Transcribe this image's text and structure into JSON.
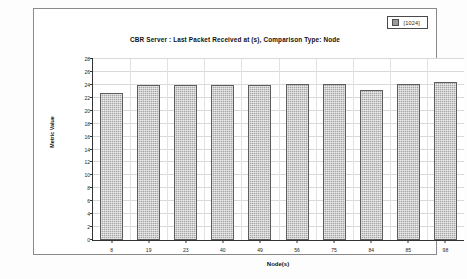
{
  "legend": {
    "swatch_color": "#9a9a9a",
    "label": "[1024]"
  },
  "chart_data": {
    "type": "bar",
    "title": "CBR Server :  Last Packet Received at (s), Comparison Type: Node",
    "xlabel": "Node(s)",
    "ylabel": "Metric Value",
    "categories": [
      "8",
      "19",
      "23",
      "40",
      "49",
      "56",
      "75",
      "84",
      "85",
      "98"
    ],
    "values": [
      22.8,
      24.0,
      24.0,
      24.0,
      24.0,
      24.1,
      24.1,
      23.2,
      24.1,
      24.4
    ],
    "series": [
      {
        "name": "[1024]",
        "values": [
          22.8,
          24.0,
          24.0,
          24.0,
          24.0,
          24.1,
          24.1,
          23.2,
          24.1,
          24.4
        ]
      }
    ],
    "ylim": [
      0,
      28
    ],
    "ytick_values": [
      0,
      2,
      4,
      6,
      8,
      10,
      12,
      14,
      16,
      18,
      20,
      22,
      24,
      26,
      28
    ],
    "ytick_labels": [
      "0",
      "2",
      "4",
      "6",
      "8",
      "10",
      "12",
      "14",
      "16",
      "18",
      "20",
      "22",
      "24",
      "26",
      "28"
    ],
    "grid": true,
    "legend_position": "top-right",
    "bar_color": "#a6a6a6",
    "bar_edge_color": "#5d5d5d"
  }
}
